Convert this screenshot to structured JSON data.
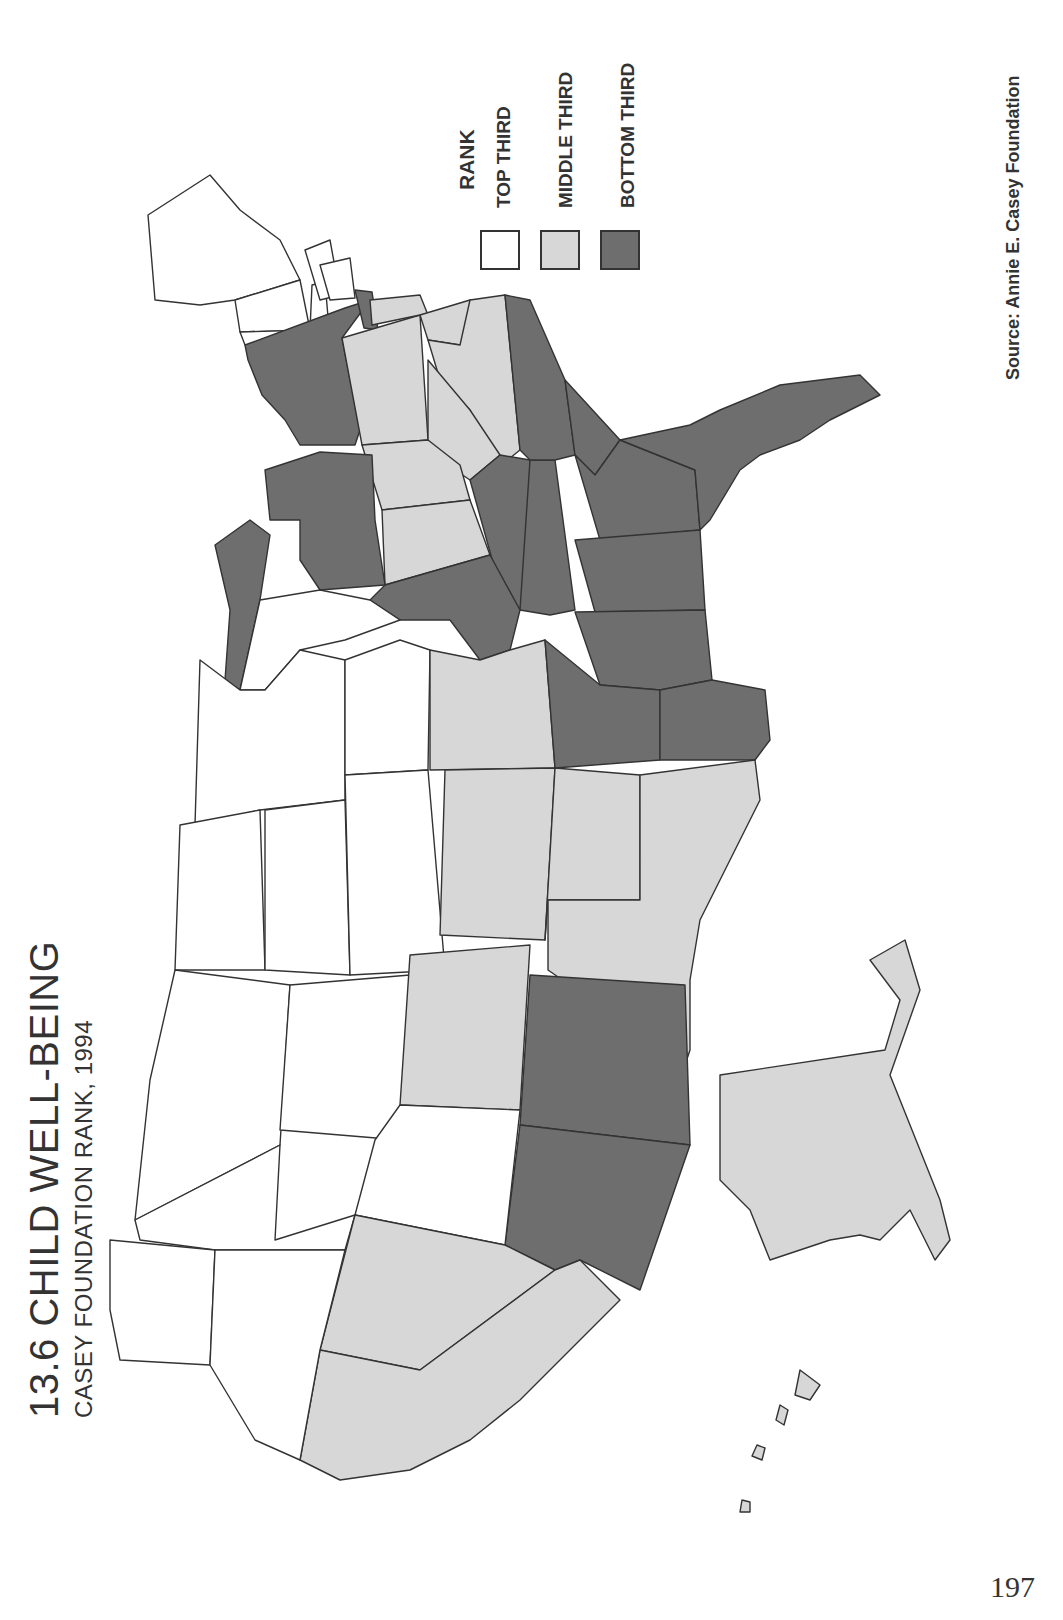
{
  "page": {
    "title": "13.6 CHILD WELL-BEING",
    "subtitle": "CASEY FOUNDATION RANK, 1994",
    "source": "Source:  Annie  E.  Casey  Foundation",
    "page_number": "197",
    "orientation": "rotated 90° counter-clockwise (north at left, east at top)"
  },
  "legend": {
    "title": "RANK",
    "items": [
      {
        "label": "TOP THIRD",
        "color": "#ffffff"
      },
      {
        "label": "MIDDLE THIRD",
        "color": "#d7d7d7"
      },
      {
        "label": "BOTTOM THIRD",
        "color": "#6e6e6e"
      }
    ]
  },
  "map_data": {
    "type": "choropleth",
    "region": "United States",
    "variable": "Child well-being rank, 1994",
    "categories": [
      "TOP THIRD",
      "MIDDLE THIRD",
      "BOTTOM THIRD"
    ],
    "states": {
      "top_third": [
        "Maine",
        "New Hampshire",
        "Vermont",
        "Massachusetts",
        "Connecticut",
        "Rhode Island",
        "Wisconsin",
        "Minnesota",
        "North Dakota",
        "South Dakota",
        "Iowa",
        "Nebraska",
        "Montana",
        "Wyoming",
        "Idaho",
        "Utah",
        "Washington",
        "Oregon"
      ],
      "middle_third": [
        "Pennsylvania",
        "New Jersey",
        "Delaware",
        "Maryland",
        "Virginia",
        "West Virginia",
        "Ohio",
        "Indiana",
        "Missouri",
        "Kansas",
        "Oklahoma",
        "Texas",
        "Colorado",
        "Nevada",
        "California",
        "Alaska",
        "Hawaii"
      ],
      "bottom_third": [
        "New York",
        "Michigan",
        "Illinois",
        "Kentucky",
        "Tennessee",
        "North Carolina",
        "South Carolina",
        "Georgia",
        "Florida",
        "Alabama",
        "Mississippi",
        "Louisiana",
        "Arkansas",
        "New Mexico",
        "Arizona"
      ]
    }
  }
}
